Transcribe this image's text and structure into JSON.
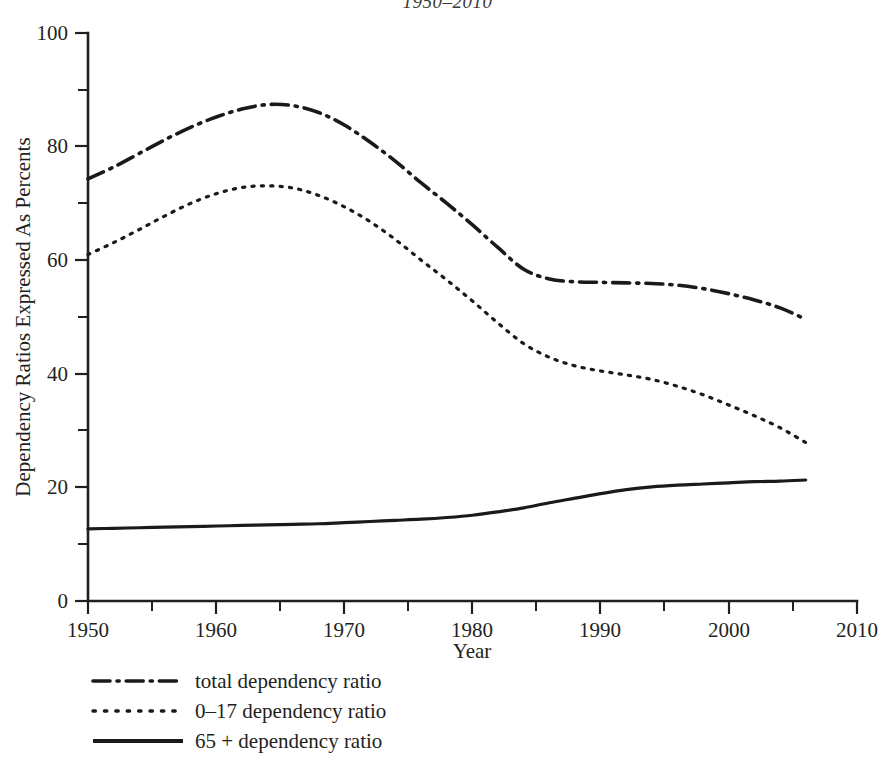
{
  "figure": {
    "title": "1950–2010",
    "background": "#ffffff",
    "ink_color": "#231f20"
  },
  "chart_data": {
    "type": "line",
    "title": "1950–2010",
    "xlabel": "Year",
    "ylabel": "Dependency Ratios Expressed As Percents",
    "xlim": [
      1950,
      2010
    ],
    "ylim": [
      0,
      100
    ],
    "grid": false,
    "legend_position": "below-left",
    "x_major_ticks": [
      1950,
      1960,
      1970,
      1980,
      1990,
      2000,
      2010
    ],
    "x_minor_ticks": [
      1955,
      1965,
      1975,
      1985,
      1995,
      2005
    ],
    "y_major_ticks": [
      0,
      20,
      40,
      60,
      80,
      100
    ],
    "y_minor_ticks": [
      10,
      30,
      50,
      70,
      90
    ],
    "x": [
      1950,
      1952,
      1954,
      1956,
      1958,
      1960,
      1962,
      1964,
      1966,
      1968,
      1970,
      1972,
      1974,
      1976,
      1978,
      1980,
      1982,
      1984,
      1986,
      1988,
      1990,
      1992,
      1994,
      1996,
      1998,
      2000,
      2002,
      2004,
      2006
    ],
    "series": [
      {
        "name": "total dependency ratio",
        "style": "dash-dot",
        "color": "#1a1a1a",
        "values": [
          74.3,
          76.4,
          78.8,
          81.2,
          83.4,
          85.2,
          86.6,
          87.4,
          87.2,
          86.0,
          83.8,
          80.8,
          77.4,
          73.6,
          70.0,
          66.2,
          62.2,
          58.4,
          56.7,
          56.2,
          56.1,
          56.0,
          55.9,
          55.6,
          55.0,
          54.1,
          53.0,
          51.6,
          49.6
        ]
      },
      {
        "name": "0–17 dependency ratio",
        "style": "dotted",
        "color": "#1a1a1a",
        "values": [
          61.0,
          63.1,
          65.4,
          67.8,
          70.0,
          71.7,
          72.8,
          73.1,
          72.7,
          71.4,
          69.4,
          66.8,
          63.6,
          60.0,
          56.5,
          52.8,
          48.9,
          45.3,
          42.9,
          41.4,
          40.5,
          39.8,
          39.0,
          37.8,
          36.3,
          34.5,
          32.6,
          30.5,
          27.9
        ]
      },
      {
        "name": "65 + dependency ratio",
        "style": "solid",
        "color": "#1a1a1a",
        "values": [
          12.7,
          12.8,
          12.9,
          13.0,
          13.1,
          13.2,
          13.3,
          13.4,
          13.5,
          13.6,
          13.8,
          14.0,
          14.2,
          14.4,
          14.7,
          15.1,
          15.7,
          16.4,
          17.3,
          18.1,
          18.9,
          19.6,
          20.1,
          20.4,
          20.6,
          20.8,
          21.0,
          21.1,
          21.3
        ]
      }
    ]
  },
  "axes": {
    "x_label": "Year",
    "y_label": "Dependency Ratios Expressed As Percents",
    "x_tick_labels": [
      "1950",
      "1960",
      "1970",
      "1980",
      "1990",
      "2000",
      "2010"
    ],
    "y_tick_labels": [
      "0",
      "20",
      "40",
      "60",
      "80",
      "100"
    ]
  },
  "legend": {
    "items": [
      {
        "label": "total dependency ratio",
        "key": "dash-dot-line-key"
      },
      {
        "label": "0–17 dependency ratio",
        "key": "dotted-line-key"
      },
      {
        "label": "65 + dependency ratio",
        "key": "solid-line-key"
      }
    ]
  }
}
